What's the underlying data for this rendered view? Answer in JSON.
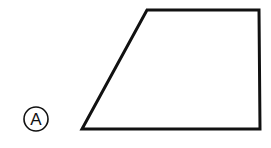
{
  "figure": {
    "label": "A",
    "shape": "trapezoid",
    "colors": {
      "stroke": "#111111",
      "background": "#ffffff"
    }
  }
}
